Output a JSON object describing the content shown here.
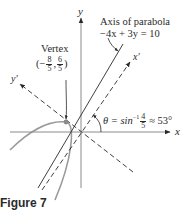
{
  "figure": {
    "caption": "Figure 7",
    "axes": {
      "x_label": "x",
      "y_label": "y",
      "x_prime_label": "x′",
      "y_prime_label": "y′"
    },
    "axis_of_parabola": {
      "title": "Axis of parabola",
      "equation": "−4x + 3y = 10"
    },
    "vertex": {
      "title": "Vertex",
      "open": "(−",
      "x_num": "8",
      "x_den": "5",
      "sep": ",",
      "y_num": "6",
      "y_den": "5",
      "close": ")"
    },
    "angle": {
      "lhs": "θ = sin",
      "sup": "−1",
      "num": "4",
      "den": "5",
      "rhs": "≈ 53°"
    },
    "colors": {
      "ink": "#2a2a2a",
      "curve": "#9a9a9a",
      "vertex_dot": "#8a8a8a"
    }
  }
}
